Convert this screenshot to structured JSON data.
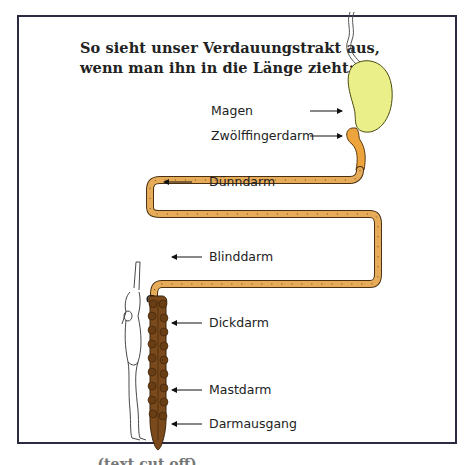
{
  "title": {
    "line1": "So sieht unser Verdauungstrakt aus,",
    "line2": "wenn man ihn in die Länge zieht:"
  },
  "labels": {
    "magen": "Magen",
    "zwoelffingerdarm": "Zwölffingerdarm",
    "duenndarm": "Dünndarm",
    "blinddarm": "Blinddarm",
    "dickdarm": "Dickdarm",
    "mastdarm": "Mastdarm",
    "darmausgang": "Darmausgang"
  },
  "cutoff_text": "… … … … (text cut off)",
  "colors": {
    "frame_border": "#2a2a40",
    "stomach_fill": "#eaef8a",
    "small_intestine_fill": "#e7ac5a",
    "duodenum_fill": "#eda43c",
    "large_intestine_fill": "#7a4a1c",
    "outline": "#3a2a10"
  }
}
